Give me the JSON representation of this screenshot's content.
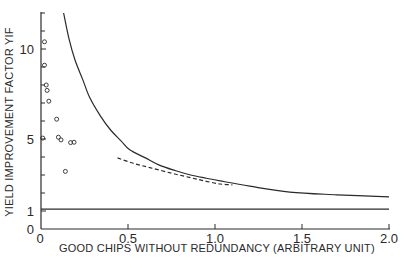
{
  "chart_data": {
    "type": "line",
    "title": "",
    "xlabel": "GOOD CHIPS WITHOUT REDUNDANCY (ARBITRARY UNIT)",
    "ylabel": "YIELD IMPROVEMENT FACTOR YIF",
    "xlim": [
      0,
      2.0
    ],
    "ylim": [
      0,
      12
    ],
    "grid": false,
    "legend": null,
    "x_ticks": [
      {
        "value": 0,
        "label": "0"
      },
      {
        "value": 0.5,
        "label": "0.5"
      },
      {
        "value": 1.0,
        "label": "1.0"
      },
      {
        "value": 1.5,
        "label": "1.5"
      },
      {
        "value": 2.0,
        "label": "2.0"
      }
    ],
    "x_minor_ticks": [],
    "y_ticks": [
      {
        "value": 0,
        "label": "0"
      },
      {
        "value": 1,
        "label": "1"
      },
      {
        "value": 5,
        "label": "5"
      },
      {
        "value": 10,
        "label": "10"
      }
    ],
    "y_minor_ticks": [
      2,
      3,
      4,
      6,
      7,
      8,
      9,
      11,
      12
    ],
    "series": [
      {
        "name": "Theoretical YIF curve",
        "style": "solid",
        "x": [
          0.13,
          0.16,
          0.195,
          0.24,
          0.28,
          0.34,
          0.4,
          0.46,
          0.51,
          0.6,
          0.68,
          0.77,
          0.86,
          0.95,
          1.03,
          1.2,
          1.43,
          1.7,
          2.0
        ],
        "y": [
          12.0,
          10.6,
          9.4,
          8.3,
          7.3,
          6.3,
          5.5,
          4.9,
          4.4,
          3.95,
          3.55,
          3.25,
          3.0,
          2.82,
          2.67,
          2.38,
          2.05,
          1.9,
          1.78
        ]
      },
      {
        "name": "Measured trend (dashed)",
        "style": "dashed",
        "x": [
          0.44,
          0.53,
          0.63,
          0.75,
          0.86,
          0.95,
          1.03,
          1.1
        ],
        "y": [
          3.95,
          3.65,
          3.4,
          3.1,
          2.85,
          2.65,
          2.5,
          2.45
        ]
      },
      {
        "name": "YIF = 1 reference",
        "style": "solid",
        "x": [
          0,
          2.0
        ],
        "y": [
          1.1,
          1.1
        ]
      },
      {
        "name": "Measured data points",
        "style": "markers",
        "marker": "open-circle",
        "x": [
          0.02,
          0.02,
          0.03,
          0.035,
          0.045,
          0.09,
          0.01,
          0.1,
          0.115,
          0.17,
          0.19,
          0.14
        ],
        "y": [
          10.4,
          9.1,
          8.0,
          7.7,
          7.1,
          6.1,
          5.05,
          5.1,
          4.95,
          4.8,
          4.82,
          3.2
        ]
      }
    ],
    "colors": {
      "ink": "#2a2a2a",
      "background": "#ffffff"
    }
  }
}
